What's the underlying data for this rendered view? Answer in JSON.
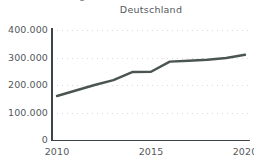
{
  "figure": {
    "clipped_heading_fragment": "Bevölkerung",
    "background_color": "#ffffff"
  },
  "chart_data": {
    "type": "line",
    "title": "Deutschland",
    "xlabel": "",
    "ylabel": "",
    "x": [
      2010,
      2011,
      2012,
      2013,
      2014,
      2015,
      2016,
      2017,
      2018,
      2019,
      2020
    ],
    "values": [
      160000,
      180000,
      200000,
      218000,
      247000,
      248000,
      285000,
      288000,
      292000,
      298000,
      310000
    ],
    "series": [
      {
        "name": "Deutschland",
        "values": [
          160000,
          180000,
          200000,
          218000,
          247000,
          248000,
          285000,
          288000,
          292000,
          298000,
          310000
        ]
      }
    ],
    "xlim": [
      2010,
      2020
    ],
    "ylim": [
      0,
      400000
    ],
    "y_ticks": [
      0,
      100000,
      200000,
      300000,
      400000
    ],
    "y_tick_labels": [
      "0",
      "100.000",
      "200.000",
      "300.000",
      "400.000"
    ],
    "x_ticks": [
      2010,
      2015,
      2020
    ],
    "x_tick_labels": [
      "2010",
      "2015",
      "2020"
    ],
    "grid": "horizontal-dotted",
    "legend": "none",
    "line_color": "#4a5550",
    "grid_color": "#dadada",
    "axis_color": "#3d4447",
    "text_color": "#54595c"
  }
}
